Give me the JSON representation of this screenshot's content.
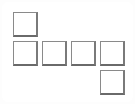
{
  "diagram": {
    "type": "cube-net",
    "border_color": "#7a7a7a",
    "fill_color": "#ffffff",
    "squares": [
      {
        "id": "top",
        "col": 0,
        "row": 0,
        "x": 13,
        "y": 12
      },
      {
        "id": "row-1",
        "col": 0,
        "row": 1,
        "x": 13,
        "y": 41
      },
      {
        "id": "row-2",
        "col": 1,
        "row": 1,
        "x": 42,
        "y": 41
      },
      {
        "id": "row-3",
        "col": 2,
        "row": 1,
        "x": 71,
        "y": 41
      },
      {
        "id": "row-4",
        "col": 3,
        "row": 1,
        "x": 100,
        "y": 41
      },
      {
        "id": "bottom",
        "col": 3,
        "row": 2,
        "x": 100,
        "y": 70
      }
    ]
  }
}
